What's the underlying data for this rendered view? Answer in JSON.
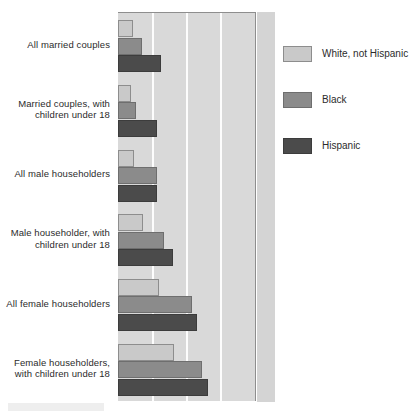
{
  "chart_data": {
    "type": "bar",
    "orientation": "horizontal",
    "title": "",
    "subtitle": "",
    "xlabel": "",
    "ylabel": "",
    "grid": true,
    "gridlines_x": [
      1,
      2,
      3
    ],
    "xlim": [
      0,
      4.03
    ],
    "axis_tick_labels": [],
    "legend_position": "right",
    "categories": [
      "All married couples",
      "Married couples, with children under 18",
      "All male householders",
      "Male householder, with children under 18",
      "All female householders",
      "Female householders, with children under 18"
    ],
    "series": [
      {
        "name": "White, not Hispanic",
        "color": "#c9c9c9",
        "values": [
          0.44,
          0.38,
          0.47,
          0.74,
          1.21,
          1.65
        ]
      },
      {
        "name": "Black",
        "color": "#8b8b8b",
        "values": [
          0.71,
          0.53,
          1.15,
          1.35,
          2.18,
          2.47
        ]
      },
      {
        "name": "Hispanic",
        "color": "#4b4b4b",
        "values": [
          1.26,
          1.15,
          1.15,
          1.62,
          2.32,
          2.65
        ]
      }
    ]
  },
  "legend": {
    "items": [
      {
        "label": "White, not Hispanic",
        "color": "#c9c9c9"
      },
      {
        "label": "Black",
        "color": "#8b8b8b"
      },
      {
        "label": "Hispanic",
        "color": "#4b4b4b"
      }
    ]
  },
  "colors": {
    "plot_background": "#d9d9d9",
    "plot_right_margin": "#d4d4d4",
    "gridline": "#fdfdfd",
    "axis_line": "#8e8e8e",
    "text": "#2b2b2b",
    "series_white_not_hispanic": "#c9c9c9",
    "series_black": "#8b8b8b",
    "series_hispanic": "#4b4b4b"
  }
}
